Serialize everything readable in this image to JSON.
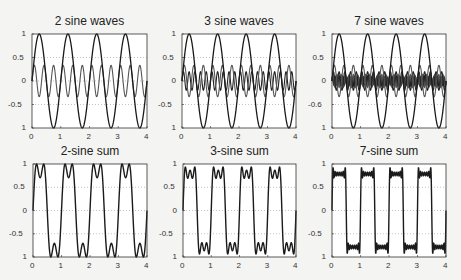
{
  "figure": {
    "panels": [
      {
        "id": "p1",
        "title": "2 sine waves",
        "kind": "components",
        "n": 2,
        "box": [
          32,
          34,
          147,
          128
        ]
      },
      {
        "id": "p2",
        "title": "3 sine waves",
        "kind": "components",
        "n": 3,
        "box": [
          182,
          34,
          296,
          128
        ]
      },
      {
        "id": "p3",
        "title": "7 sine waves",
        "kind": "components",
        "n": 7,
        "box": [
          332,
          34,
          446,
          128
        ]
      },
      {
        "id": "p4",
        "title": "2-sine sum",
        "kind": "sum",
        "n": 2,
        "box": [
          33,
          164,
          147,
          257
        ]
      },
      {
        "id": "p5",
        "title": "3-sine sum",
        "kind": "sum",
        "n": 3,
        "box": [
          183,
          164,
          296,
          257
        ]
      },
      {
        "id": "p6",
        "title": "7-sine sum",
        "kind": "sum",
        "n": 7,
        "box": [
          332,
          164,
          446,
          257
        ]
      }
    ],
    "yticks_top": [
      "1",
      "0.5",
      "0",
      "-0.5",
      "1"
    ],
    "yticks_p3": [
      "1",
      "0.5",
      "0",
      "-0.6",
      "1"
    ],
    "yticks_bottom": [
      "1",
      "0.5",
      "0",
      "-0.5",
      "1"
    ],
    "xticks": [
      "0",
      "1",
      "2",
      "3",
      "4"
    ],
    "line_color": "#1a1a1a",
    "component_color": "#555555",
    "grid_color": "#9a9a9a"
  },
  "chart_data": [
    {
      "type": "line",
      "title": "2 sine waves",
      "xlabel": "",
      "ylabel": "",
      "xlim": [
        0,
        4
      ],
      "ylim": [
        -1,
        1
      ],
      "grid": "dotted y",
      "series": [
        {
          "name": "sin(2πt)",
          "amplitude": 1,
          "frequency": 1
        },
        {
          "name": "sin(6πt)/3",
          "amplitude": 0.333,
          "frequency": 3
        }
      ],
      "xticks": [
        0,
        1,
        2,
        3,
        4
      ],
      "yticks": [
        1,
        0.5,
        0,
        -0.5,
        -1
      ]
    },
    {
      "type": "line",
      "title": "3 sine waves",
      "xlabel": "",
      "ylabel": "",
      "xlim": [
        0,
        4
      ],
      "ylim": [
        -1,
        1
      ],
      "grid": "dotted y",
      "series": [
        {
          "name": "sin(2πt)",
          "amplitude": 1,
          "frequency": 1
        },
        {
          "name": "sin(6πt)/3",
          "amplitude": 0.333,
          "frequency": 3
        },
        {
          "name": "sin(10πt)/5",
          "amplitude": 0.2,
          "frequency": 5
        }
      ],
      "xticks": [
        0,
        1,
        2,
        3,
        4
      ],
      "yticks": [
        1,
        0.5,
        0,
        -0.5,
        -1
      ]
    },
    {
      "type": "line",
      "title": "7 sine waves",
      "xlabel": "",
      "ylabel": "",
      "xlim": [
        0,
        4
      ],
      "ylim": [
        -1,
        1
      ],
      "grid": "dotted y",
      "series": [
        {
          "name": "k=1",
          "amplitude": 1,
          "frequency": 1
        },
        {
          "name": "k=3",
          "amplitude": 0.333,
          "frequency": 3
        },
        {
          "name": "k=5",
          "amplitude": 0.2,
          "frequency": 5
        },
        {
          "name": "k=7",
          "amplitude": 0.143,
          "frequency": 7
        },
        {
          "name": "k=9",
          "amplitude": 0.111,
          "frequency": 9
        },
        {
          "name": "k=11",
          "amplitude": 0.091,
          "frequency": 11
        },
        {
          "name": "k=13",
          "amplitude": 0.077,
          "frequency": 13
        }
      ],
      "xticks": [
        0,
        1,
        2,
        3,
        4
      ],
      "yticks": [
        1,
        0.5,
        0,
        -0.6,
        -1
      ]
    },
    {
      "type": "line",
      "title": "2-sine sum",
      "xlim": [
        0,
        4
      ],
      "ylim": [
        -1,
        1
      ],
      "grid": "dotted y",
      "series": [
        {
          "name": "sum of 2 odd harmonics",
          "peak": 1.0,
          "dip": 0.6
        }
      ],
      "xticks": [
        0,
        1,
        2,
        3,
        4
      ],
      "yticks": [
        1,
        0.5,
        0,
        -0.5,
        -1
      ]
    },
    {
      "type": "line",
      "title": "3-sine sum",
      "xlim": [
        0,
        4
      ],
      "ylim": [
        -1,
        1
      ],
      "grid": "dotted y",
      "series": [
        {
          "name": "sum of 3 odd harmonics",
          "peak": 1.0,
          "dip": 0.7
        }
      ],
      "xticks": [
        0,
        1,
        2,
        3,
        4
      ],
      "yticks": [
        1,
        0.5,
        0,
        -0.5,
        -1
      ]
    },
    {
      "type": "line",
      "title": "7-sine sum",
      "xlim": [
        0,
        4
      ],
      "ylim": [
        -1,
        1
      ],
      "grid": "dotted y",
      "series": [
        {
          "name": "sum of 7 odd harmonics",
          "plateau": 0.78
        }
      ],
      "xticks": [
        0,
        1,
        2,
        3,
        4
      ],
      "yticks": [
        1,
        0.5,
        0,
        -0.5,
        -1
      ]
    }
  ]
}
